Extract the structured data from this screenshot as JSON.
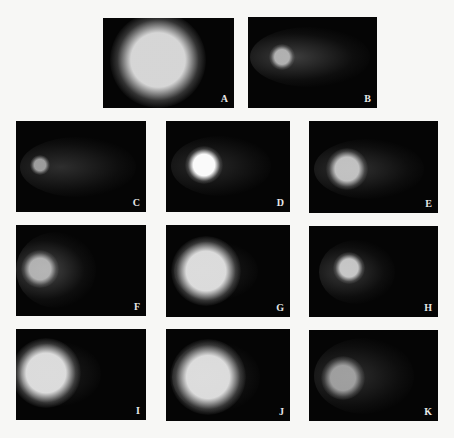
{
  "figure": {
    "background_color": "#f7f7f5",
    "panel_color": "#050505",
    "panels": [
      {
        "label": "A",
        "x": 103,
        "y": 18,
        "w": 131,
        "h": 90,
        "head": {
          "cx": 55,
          "cy": 42,
          "r": 30,
          "color": "rgba(225,225,225,0.95)"
        },
        "tail": null
      },
      {
        "label": "B",
        "x": 248,
        "y": 17,
        "w": 129,
        "h": 91,
        "head": {
          "cx": 34,
          "cy": 40,
          "r": 8,
          "color": "rgba(190,190,190,0.9)"
        },
        "tail": {
          "cx": 62,
          "cy": 40,
          "rx": 60,
          "ry": 30,
          "color": "rgba(110,110,110,0.55)"
        }
      },
      {
        "label": "C",
        "x": 16,
        "y": 121,
        "w": 130,
        "h": 91,
        "head": {
          "cx": 24,
          "cy": 44,
          "r": 6,
          "color": "rgba(170,170,170,0.9)"
        },
        "tail": {
          "cx": 62,
          "cy": 46,
          "rx": 58,
          "ry": 30,
          "color": "rgba(80,80,80,0.55)"
        }
      },
      {
        "label": "D",
        "x": 166,
        "y": 121,
        "w": 124,
        "h": 91,
        "head": {
          "cx": 38,
          "cy": 44,
          "r": 12,
          "color": "rgba(250,250,250,1)"
        },
        "tail": {
          "cx": 55,
          "cy": 45,
          "rx": 50,
          "ry": 30,
          "color": "rgba(70,70,70,0.55)"
        }
      },
      {
        "label": "E",
        "x": 309,
        "y": 121,
        "w": 129,
        "h": 92,
        "head": {
          "cx": 38,
          "cy": 48,
          "r": 13,
          "color": "rgba(210,210,210,0.9)"
        },
        "tail": {
          "cx": 60,
          "cy": 48,
          "rx": 55,
          "ry": 30,
          "color": "rgba(85,85,85,0.55)"
        }
      },
      {
        "label": "F",
        "x": 16,
        "y": 225,
        "w": 130,
        "h": 91,
        "head": {
          "cx": 24,
          "cy": 44,
          "r": 12,
          "color": "rgba(200,200,200,0.85)"
        },
        "tail": {
          "cx": 40,
          "cy": 45,
          "rx": 40,
          "ry": 38,
          "color": "rgba(120,120,120,0.6)"
        }
      },
      {
        "label": "G",
        "x": 166,
        "y": 225,
        "w": 124,
        "h": 92,
        "head": {
          "cx": 40,
          "cy": 46,
          "r": 22,
          "color": "rgba(230,230,230,0.95)"
        },
        "tail": {
          "cx": 50,
          "cy": 46,
          "rx": 42,
          "ry": 30,
          "color": "rgba(60,60,60,0.5)"
        }
      },
      {
        "label": "H",
        "x": 309,
        "y": 226,
        "w": 129,
        "h": 91,
        "head": {
          "cx": 40,
          "cy": 42,
          "r": 10,
          "color": "rgba(215,215,215,0.9)"
        },
        "tail": {
          "cx": 48,
          "cy": 46,
          "rx": 38,
          "ry": 32,
          "color": "rgba(100,100,100,0.55)"
        }
      },
      {
        "label": "I",
        "x": 16,
        "y": 329,
        "w": 130,
        "h": 91,
        "head": {
          "cx": 30,
          "cy": 44,
          "r": 22,
          "color": "rgba(230,230,230,0.95)"
        },
        "tail": {
          "cx": 45,
          "cy": 45,
          "rx": 40,
          "ry": 32,
          "color": "rgba(60,60,60,0.5)"
        }
      },
      {
        "label": "J",
        "x": 166,
        "y": 329,
        "w": 124,
        "h": 92,
        "head": {
          "cx": 42,
          "cy": 48,
          "r": 24,
          "color": "rgba(230,230,230,0.95)"
        },
        "tail": {
          "cx": 50,
          "cy": 48,
          "rx": 44,
          "ry": 36,
          "color": "rgba(90,90,90,0.55)"
        }
      },
      {
        "label": "K",
        "x": 309,
        "y": 330,
        "w": 129,
        "h": 91,
        "head": {
          "cx": 34,
          "cy": 48,
          "r": 14,
          "color": "rgba(180,180,180,0.85)"
        },
        "tail": {
          "cx": 55,
          "cy": 46,
          "rx": 50,
          "ry": 38,
          "color": "rgba(80,80,80,0.55)"
        }
      }
    ]
  }
}
